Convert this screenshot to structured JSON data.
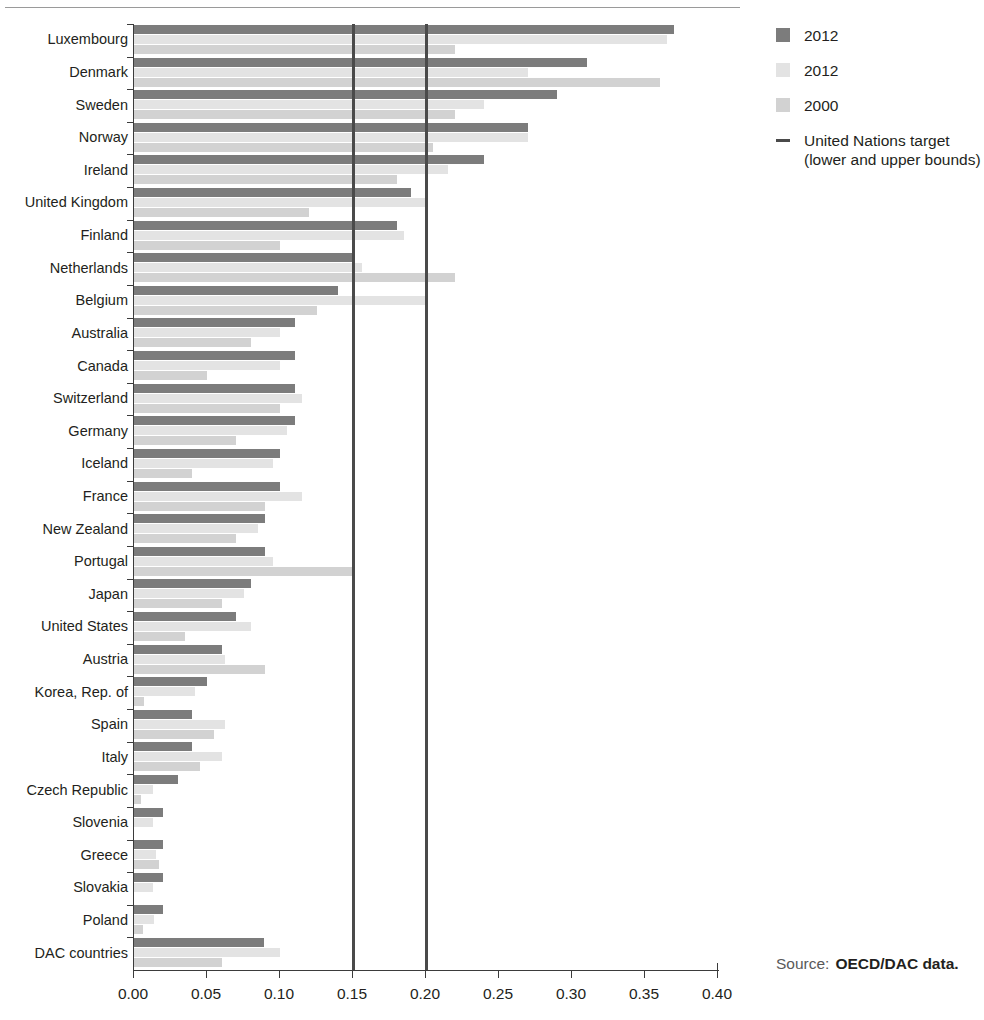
{
  "source": {
    "label": "Source:",
    "value": "OECD/DAC data."
  },
  "legend": {
    "items": [
      {
        "label": "2012",
        "marker": "swatch",
        "color": "#7c7c7c"
      },
      {
        "label": "2012",
        "marker": "swatch",
        "color": "#e3e3e3"
      },
      {
        "label": "2000",
        "marker": "swatch",
        "color": "#d2d2d2"
      }
    ],
    "target": {
      "marker": "line",
      "color": "#4a4a4a",
      "line1": "United Nations target",
      "line2": "(lower and upper bounds)"
    }
  },
  "chart_data": {
    "type": "bar",
    "orientation": "horizontal",
    "title": "",
    "xlabel": "",
    "ylabel": "",
    "xlim": [
      0.0,
      0.4
    ],
    "xticks": [
      0.0,
      0.05,
      0.1,
      0.15,
      0.2,
      0.25,
      0.3,
      0.35,
      0.4
    ],
    "xtick_labels": [
      "0.00",
      "0.05",
      "0.10",
      "0.15",
      "0.20",
      "0.25",
      "0.30",
      "0.35",
      "0.40"
    ],
    "grid": false,
    "legend_position": "right",
    "reference_lines": [
      {
        "value": 0.15,
        "label": "United Nations target (lower bound)",
        "color": "#4a4a4a"
      },
      {
        "value": 0.2,
        "label": "United Nations target (upper bound)",
        "color": "#4a4a4a"
      }
    ],
    "categories": [
      "Luxembourg",
      "Denmark",
      "Sweden",
      "Norway",
      "Ireland",
      "United Kingdom",
      "Finland",
      "Netherlands",
      "Belgium",
      "Australia",
      "Canada",
      "Switzerland",
      "Germany",
      "Iceland",
      "France",
      "New Zealand",
      "Portugal",
      "Japan",
      "United States",
      "Austria",
      "Korea, Rep. of",
      "Spain",
      "Italy",
      "Czech Republic",
      "Slovenia",
      "Greece",
      "Slovakia",
      "Poland",
      "DAC countries"
    ],
    "series": [
      {
        "name": "2012",
        "color": "#7c7c7c",
        "values": [
          0.37,
          0.31,
          0.29,
          0.27,
          0.24,
          0.19,
          0.18,
          0.15,
          0.14,
          0.11,
          0.11,
          0.11,
          0.11,
          0.1,
          0.1,
          0.09,
          0.09,
          0.08,
          0.07,
          0.06,
          0.05,
          0.04,
          0.04,
          0.03,
          0.02,
          0.02,
          0.02,
          0.02,
          0.089
        ]
      },
      {
        "name": "2012",
        "color": "#e3e3e3",
        "values": [
          0.365,
          0.27,
          0.24,
          0.27,
          0.215,
          0.2,
          0.185,
          0.156,
          0.2,
          0.1,
          0.1,
          0.115,
          0.105,
          0.095,
          0.115,
          0.085,
          0.095,
          0.075,
          0.08,
          0.062,
          0.042,
          0.062,
          0.06,
          0.013,
          0.013,
          0.015,
          0.013,
          0.014,
          0.1
        ]
      },
      {
        "name": "2000",
        "color": "#d2d2d2",
        "values": [
          0.22,
          0.36,
          0.22,
          0.205,
          0.18,
          0.12,
          0.1,
          0.22,
          0.125,
          0.08,
          0.05,
          0.1,
          0.07,
          0.04,
          0.09,
          0.07,
          0.15,
          0.06,
          0.035,
          0.09,
          0.007,
          0.055,
          0.045,
          0.005,
          0.0,
          0.017,
          0.0,
          0.006,
          0.06
        ]
      }
    ]
  }
}
